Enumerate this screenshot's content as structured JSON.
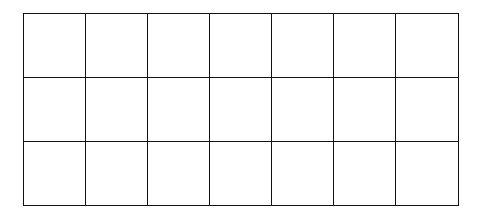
{
  "grid": {
    "rows": 3,
    "columns": 7,
    "line_color": "#111111",
    "fill_color": "#ffffff",
    "cells": [
      [
        "",
        "",
        "",
        "",
        "",
        "",
        ""
      ],
      [
        "",
        "",
        "",
        "",
        "",
        "",
        ""
      ],
      [
        "",
        "",
        "",
        "",
        "",
        "",
        ""
      ]
    ]
  }
}
